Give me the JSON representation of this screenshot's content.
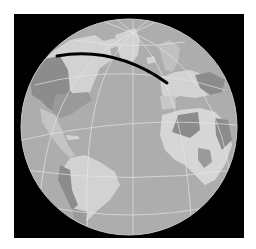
{
  "map": {
    "projection": "orthographic",
    "frame": {
      "x": 14,
      "y": 14,
      "width": 230,
      "height": 224,
      "color": "#000000"
    },
    "globe": {
      "cx": 129,
      "cy": 127,
      "r": 108
    },
    "colors": {
      "background": "#ffffff",
      "ocean": "#adadad",
      "land_light": "#d2d2d2",
      "land_mid": "#bdbdbd",
      "land_dark": "#8c8c8c",
      "graticule": "#e6e6e6",
      "route": "#000000"
    },
    "route": {
      "description": "great-circle path",
      "start": {
        "x": 57,
        "y": 56,
        "region": "western North America"
      },
      "end": {
        "x": 167,
        "y": 83,
        "region": "western Europe"
      },
      "stroke_width": 3
    },
    "regions_visible": [
      "North America",
      "Greenland",
      "Europe",
      "Africa",
      "South America",
      "Atlantic Ocean"
    ]
  }
}
